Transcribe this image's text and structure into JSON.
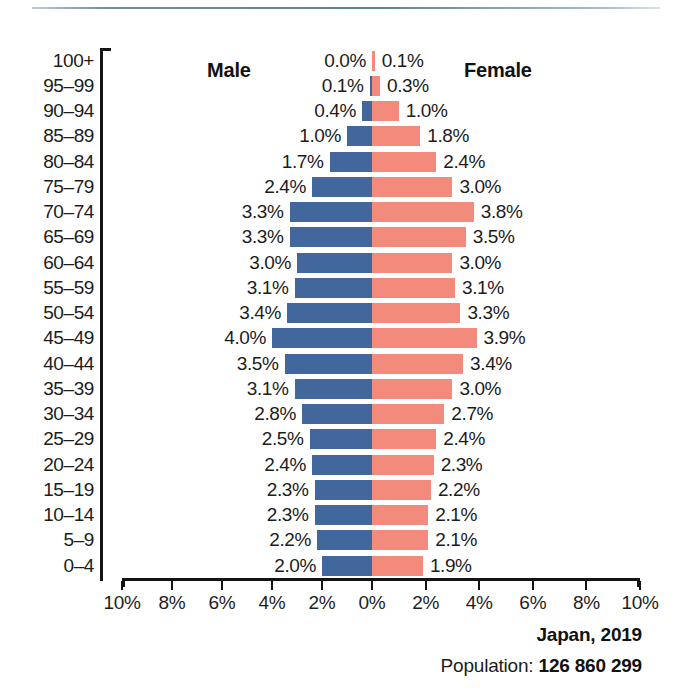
{
  "chart_data": {
    "type": "bar",
    "subtype": "population-pyramid",
    "title": "Japan, 2019",
    "xlabel": "",
    "ylabel": "",
    "xlim": [
      -10,
      10
    ],
    "grid": false,
    "legend_position": "inside-top",
    "x_tick_labels": [
      "10%",
      "8%",
      "6%",
      "4%",
      "2%",
      "0%",
      "2%",
      "4%",
      "6%",
      "8%",
      "10%"
    ],
    "x_tick_values": [
      -10,
      -8,
      -6,
      -4,
      -2,
      0,
      2,
      4,
      6,
      8,
      10
    ],
    "categories": [
      "100+",
      "95–99",
      "90–94",
      "85–89",
      "80–84",
      "75–79",
      "70–74",
      "65–69",
      "60–64",
      "55–59",
      "50–54",
      "45–49",
      "40–44",
      "35–39",
      "30–34",
      "25–29",
      "20–24",
      "15–19",
      "10–14",
      "5–9",
      "0–4"
    ],
    "series": [
      {
        "name": "Male",
        "color": "#41679d",
        "side": "left",
        "values": [
          0.0,
          0.1,
          0.4,
          1.0,
          1.7,
          2.4,
          3.3,
          3.3,
          3.0,
          3.1,
          3.4,
          4.0,
          3.5,
          3.1,
          2.8,
          2.5,
          2.4,
          2.3,
          2.3,
          2.2,
          2.0
        ],
        "labels": [
          "0.0%",
          "0.1%",
          "0.4%",
          "1.0%",
          "1.7%",
          "2.4%",
          "3.3%",
          "3.3%",
          "3.0%",
          "3.1%",
          "3.4%",
          "4.0%",
          "3.5%",
          "3.1%",
          "2.8%",
          "2.5%",
          "2.4%",
          "2.3%",
          "2.3%",
          "2.2%",
          "2.0%"
        ]
      },
      {
        "name": "Female",
        "color": "#f28b7b",
        "side": "right",
        "values": [
          0.1,
          0.3,
          1.0,
          1.8,
          2.4,
          3.0,
          3.8,
          3.5,
          3.0,
          3.1,
          3.3,
          3.9,
          3.4,
          3.0,
          2.7,
          2.4,
          2.3,
          2.2,
          2.1,
          2.1,
          1.9
        ],
        "labels": [
          "0.1%",
          "0.3%",
          "1.0%",
          "1.8%",
          "2.4%",
          "3.0%",
          "3.8%",
          "3.5%",
          "3.0%",
          "3.1%",
          "3.3%",
          "3.9%",
          "3.4%",
          "3.0%",
          "2.7%",
          "2.4%",
          "2.3%",
          "2.2%",
          "2.1%",
          "2.1%",
          "1.9%"
        ]
      }
    ],
    "annotations": {
      "male_caption": "Male",
      "female_caption": "Female"
    }
  },
  "footer": {
    "title": "Japan, 2019",
    "population_label": "Population:",
    "population_value": "126 860 299"
  },
  "colors": {
    "male": "#41679d",
    "female": "#f28b7b",
    "axis": "#141414",
    "rule": "#5d848c",
    "text": "#1c1c1c"
  }
}
